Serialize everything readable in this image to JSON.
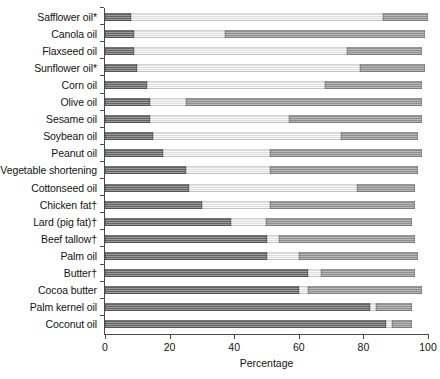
{
  "chart_data": {
    "type": "bar",
    "subtype": "stacked-horizontal-bar",
    "title": "",
    "xlabel": "Percentage",
    "ylabel": "",
    "xlim": [
      0,
      100
    ],
    "xticks": [
      0,
      20,
      40,
      60,
      80,
      100
    ],
    "grid": false,
    "legend_position": "none",
    "orientation": "horizontal",
    "stacked": true,
    "categories": [
      "Safflower oil*",
      "Canola oil",
      "Flaxseed oil",
      "Sunflower oil*",
      "Corn oil",
      "Olive oil",
      "Sesame oil",
      "Soybean oil",
      "Peanut oil",
      "Vegetable shortening",
      "Cottonseed oil",
      "Chicken fat†",
      "Lard (pig fat)†",
      "Beef tallow†",
      "Palm oil",
      "Butter†",
      "Cocoa butter",
      "Palm kernel oil",
      "Coconut oil"
    ],
    "series": [
      {
        "name": "Saturated fat",
        "color": "#6e6e6e",
        "values": [
          8,
          9,
          9,
          10,
          13,
          14,
          14,
          15,
          18,
          25,
          26,
          30,
          39,
          50,
          50,
          63,
          60,
          82,
          87
        ]
      },
      {
        "name": "Polyunsaturated fat",
        "color": "#f0f0f0",
        "values": [
          78,
          28,
          66,
          69,
          55,
          11,
          43,
          58,
          33,
          26,
          52,
          21,
          11,
          4,
          10,
          4,
          3,
          2,
          2
        ]
      },
      {
        "name": "Monounsaturated fat",
        "color": "#9a9a9a",
        "values": [
          14,
          62,
          23,
          20,
          30,
          73,
          41,
          24,
          47,
          46,
          18,
          45,
          45,
          42,
          37,
          29,
          35,
          11,
          6
        ]
      }
    ],
    "footnotes": [
      "*",
      "†"
    ]
  },
  "axis": {
    "x_title": "Percentage",
    "tick_labels": [
      "0",
      "20",
      "40",
      "60",
      "80",
      "100"
    ]
  }
}
